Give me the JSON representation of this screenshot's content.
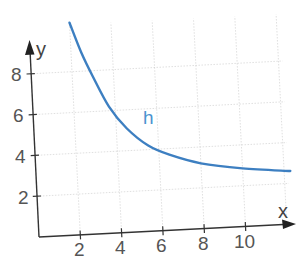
{
  "chart_data": {
    "type": "line",
    "title": "",
    "xlabel": "x",
    "ylabel": "y",
    "x_ticks": [
      2,
      4,
      6,
      8,
      10
    ],
    "y_ticks": [
      2,
      4,
      6,
      8
    ],
    "xlim": [
      0,
      12.4
    ],
    "ylim": [
      0,
      9.6
    ],
    "grid": true,
    "legend": null,
    "annotations": [
      {
        "text": "h",
        "x": 5.3,
        "y": 5.8
      }
    ],
    "series": [
      {
        "name": "h",
        "color": "#3d7fc1",
        "x": [
          2,
          2.5,
          3,
          3.7,
          4.5,
          5.5,
          6.5,
          8,
          10,
          12.3
        ],
        "y": [
          10.4,
          8.9,
          7.7,
          6.2,
          5.1,
          4.2,
          3.7,
          3.2,
          2.85,
          2.6
        ]
      }
    ]
  },
  "labels": {
    "x_axis": "x",
    "y_axis": "y",
    "curve": "h",
    "xt": [
      "2",
      "4",
      "6",
      "8",
      "10"
    ],
    "yt": [
      "2",
      "4",
      "6",
      "8"
    ]
  }
}
